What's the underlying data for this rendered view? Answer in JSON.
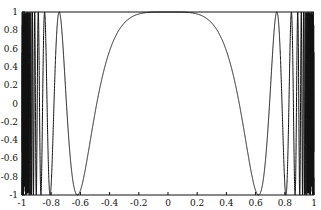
{
  "chart_data": {
    "type": "line",
    "title": "",
    "xlabel": "",
    "ylabel": "",
    "xlim": [
      -1,
      1
    ],
    "ylim": [
      -1,
      1
    ],
    "grid": false,
    "legend": null,
    "x_ticks": [
      -1,
      -0.8,
      -0.6,
      -0.4,
      -0.2,
      0,
      0.2,
      0.4,
      0.6,
      0.8,
      1
    ],
    "x_tick_labels": [
      "-1",
      "-0.8",
      "-0.6",
      "-0.4",
      "-0.2",
      "0",
      "0.2",
      "0.4",
      "0.6",
      "0.8",
      "1"
    ],
    "y_ticks": [
      -1,
      -0.8,
      -0.6,
      -0.4,
      -0.2,
      0,
      0.2,
      0.4,
      0.6,
      0.8,
      1
    ],
    "y_tick_labels": [
      "-1",
      "-0.8",
      "-0.6",
      "-0.4",
      "-0.2",
      "0",
      "0.2",
      "0.4",
      "0.6",
      "0.8",
      "1"
    ],
    "series": [
      {
        "name": "f(x)",
        "description": "Even function equal to ~1 on [-0.3,0.3], dropping to -1 at x≈±0.62, then oscillating between -1 and 1 with increasing frequency toward x=±1",
        "key_points": [
          {
            "x": -0.8,
            "y": -1
          },
          {
            "x": -0.74,
            "y": 1
          },
          {
            "x": -0.62,
            "y": -1
          },
          {
            "x": -0.4,
            "y": 0.55
          },
          {
            "x": -0.2,
            "y": 0.97
          },
          {
            "x": 0,
            "y": 1
          },
          {
            "x": 0.2,
            "y": 0.97
          },
          {
            "x": 0.4,
            "y": 0.55
          },
          {
            "x": 0.62,
            "y": -1
          },
          {
            "x": 0.74,
            "y": 1
          },
          {
            "x": 0.8,
            "y": -1
          }
        ],
        "color": "#111111"
      }
    ]
  },
  "colors": {
    "line": "#111111",
    "axis": "#111111",
    "background": "#ffffff"
  }
}
